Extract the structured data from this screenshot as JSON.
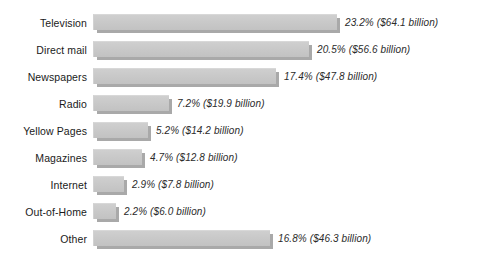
{
  "chart_data": {
    "type": "bar",
    "orientation": "horizontal",
    "title": "",
    "xlabel": "",
    "ylabel": "",
    "grid": false,
    "legend": null,
    "axis_visible": false,
    "value_unit": "percent",
    "categories": [
      "Television",
      "Direct mail",
      "Newspapers",
      "Radio",
      "Yellow Pages",
      "Magazines",
      "Internet",
      "Out-of-Home",
      "Other"
    ],
    "values": [
      23.2,
      20.5,
      17.4,
      7.2,
      5.2,
      4.7,
      2.9,
      2.2,
      16.8
    ],
    "dollars_billion": [
      64.1,
      56.6,
      47.8,
      19.9,
      14.2,
      12.8,
      7.8,
      6.0,
      46.3
    ],
    "xlim": [
      0,
      23.2
    ],
    "bars": [
      {
        "category": "Television",
        "percent": 23.2,
        "dollars": 64.1,
        "label": "23.2% ($64.1 billion)"
      },
      {
        "category": "Direct mail",
        "percent": 20.5,
        "dollars": 56.6,
        "label": "20.5% ($56.6 billion)"
      },
      {
        "category": "Newspapers",
        "percent": 17.4,
        "dollars": 47.8,
        "label": "17.4% ($47.8 billion)"
      },
      {
        "category": "Radio",
        "percent": 7.2,
        "dollars": 19.9,
        "label": "7.2% ($19.9 billion)"
      },
      {
        "category": "Yellow Pages",
        "percent": 5.2,
        "dollars": 14.2,
        "label": "5.2% ($14.2 billion)"
      },
      {
        "category": "Magazines",
        "percent": 4.7,
        "dollars": 12.8,
        "label": "4.7% ($12.8 billion)"
      },
      {
        "category": "Internet",
        "percent": 2.9,
        "dollars": 7.8,
        "label": "2.9% ($7.8 billion)"
      },
      {
        "category": "Out-of-Home",
        "percent": 2.2,
        "dollars": 6.0,
        "label": "2.2% ($6.0 billion)"
      },
      {
        "category": "Other",
        "percent": 16.8,
        "dollars": 46.3,
        "label": "16.8% ($46.3 billion)"
      }
    ],
    "colors": {
      "bar_face": "#c9c9c9",
      "bar_shadow": "#a9a9a9",
      "background": "#ffffff",
      "category_text": "#1a1a1a",
      "value_text": "#2b2b2b"
    }
  }
}
